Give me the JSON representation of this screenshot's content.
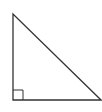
{
  "diagram": {
    "type": "right-triangle",
    "stroke_color": "#333333",
    "background": "#ffffff",
    "vertices": {
      "top": [
        13,
        14
      ],
      "bottom_left": [
        13,
        100
      ],
      "bottom_right": [
        101,
        100
      ]
    },
    "right_angle_marker": {
      "corner": "bottom_left",
      "size": 10
    }
  }
}
